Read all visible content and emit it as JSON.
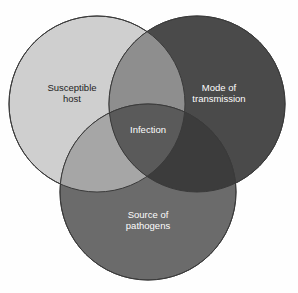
{
  "diagram": {
    "type": "venn",
    "background_color": "#fefefe",
    "stroke_color": "#3a3a3a",
    "circles": [
      {
        "id": "susceptible-host",
        "label_line1": "Susceptible",
        "label_line2": "host",
        "fill_color": "#cfcfcf",
        "text_color": "#1e1e1e",
        "cx": 97,
        "cy": 104,
        "r": 88
      },
      {
        "id": "mode-of-transmission",
        "label_line1": "Mode of",
        "label_line2": "transmission",
        "fill_color": "#4a4a4a",
        "text_color": "#fdfdfd",
        "cx": 197,
        "cy": 104,
        "r": 88
      },
      {
        "id": "source-of-pathogens",
        "label_line1": "Source of",
        "label_line2": "pathogens",
        "fill_color": "#6b6b6b",
        "text_color": "#fdfdfd",
        "cx": 148,
        "cy": 192,
        "r": 88
      }
    ],
    "intersection": {
      "id": "infection",
      "label": "Infection",
      "text_color": "#fdfdfd",
      "x": 148,
      "y": 130
    },
    "overlaps": {
      "host_transmission_color": "#8e8e8e",
      "host_source_color": "#a6a6a6",
      "transmission_source_color": "#3c3c3c",
      "center_color": "#5a5a5a"
    },
    "font_size_px": 9.5,
    "line_height_px": 11
  }
}
